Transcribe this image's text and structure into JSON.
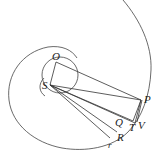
{
  "diagram": {
    "type": "geometric-figure",
    "points": {
      "S": {
        "label": "S",
        "x": 50,
        "y": 85
      },
      "O": {
        "label": "O",
        "x": 56,
        "y": 62
      },
      "P": {
        "label": "P",
        "x": 141,
        "y": 100
      },
      "Q": {
        "label": "Q",
        "x": 133,
        "y": 121
      },
      "T": {
        "label": "T",
        "x": 135,
        "y": 122
      },
      "V": {
        "label": "V",
        "x": 138,
        "y": 121
      },
      "R": {
        "label": "R",
        "x": 118,
        "y": 133
      },
      "r": {
        "label": "r",
        "x": 110,
        "y": 140
      }
    },
    "labels": {
      "O": "O",
      "S": "S",
      "P": "P",
      "Q": "Q",
      "T": "T",
      "V": "V",
      "R": "R",
      "r": "r"
    }
  }
}
